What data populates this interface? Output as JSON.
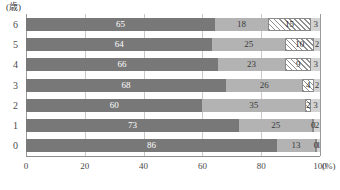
{
  "chart_data": {
    "type": "bar",
    "subtype": "horizontal-100pct-stacked",
    "title": "",
    "xlabel": "%",
    "ylabel": "(歳)",
    "unit_label": "(歳)",
    "xunit_label": "(%)",
    "categories": [
      "6",
      "5",
      "4",
      "3",
      "2",
      "1",
      "0"
    ],
    "xlim": [
      0,
      100
    ],
    "xticks": [
      "0",
      "20",
      "40",
      "60",
      "80",
      "100"
    ],
    "xtick_values": [
      0,
      20,
      40,
      60,
      80,
      100
    ],
    "grid": true,
    "legend": "none",
    "series": [
      {
        "name": "segment-1",
        "color": "#787878",
        "style": "solid",
        "values": [
          65,
          64,
          66,
          68,
          60,
          73,
          86
        ]
      },
      {
        "name": "segment-2",
        "color": "#b3b3b3",
        "style": "solid",
        "values": [
          18,
          25,
          23,
          26,
          35,
          25,
          13
        ]
      },
      {
        "name": "segment-3",
        "color": "#ffffff",
        "style": "hatched",
        "values": [
          15,
          10,
          9,
          4,
          2,
          0,
          0
        ]
      },
      {
        "name": "segment-4",
        "color": "#d3d3d3",
        "style": "solid",
        "values": [
          3,
          2,
          3,
          2,
          3,
          2,
          1
        ]
      }
    ],
    "rows": [
      {
        "label": "6",
        "values": [
          65,
          18,
          15,
          3
        ]
      },
      {
        "label": "5",
        "values": [
          64,
          25,
          10,
          2
        ]
      },
      {
        "label": "4",
        "values": [
          66,
          23,
          9,
          3
        ]
      },
      {
        "label": "3",
        "values": [
          68,
          26,
          4,
          2
        ]
      },
      {
        "label": "2",
        "values": [
          60,
          35,
          2,
          3
        ]
      },
      {
        "label": "1",
        "values": [
          73,
          25,
          0,
          2
        ]
      },
      {
        "label": "0",
        "values": [
          86,
          13,
          0,
          1
        ]
      }
    ]
  },
  "axis": {
    "unit_label": "(歳)",
    "x_unit": "(%)",
    "ticks": [
      {
        "label": "0",
        "value": 0
      },
      {
        "label": "20",
        "value": 20
      },
      {
        "label": "40",
        "value": 40
      },
      {
        "label": "60",
        "value": 60
      },
      {
        "label": "80",
        "value": 80
      },
      {
        "label": "100",
        "value": 100
      }
    ]
  }
}
